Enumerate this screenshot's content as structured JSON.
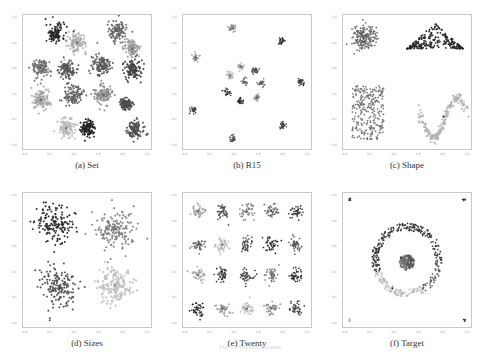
{
  "figure": {
    "caption": "Fig. — Synthetic datasets"
  },
  "chart_data": [
    {
      "type": "scatter",
      "title": "(a) Set",
      "xlim": [
        0.0,
        1.0
      ],
      "ylim": [
        0.0,
        1.0
      ],
      "xticks": [
        "0.0",
        "0.2",
        "0.4",
        "0.6",
        "0.8",
        "1.0"
      ],
      "yticks": [
        "1.0",
        "0.8",
        "0.6",
        "0.4",
        "0.2",
        "0.0"
      ],
      "grid": false,
      "clusters": [
        {
          "cx": 0.24,
          "cy": 0.88,
          "r": 0.07,
          "color": "#1e1e1e"
        },
        {
          "cx": 0.42,
          "cy": 0.81,
          "r": 0.07,
          "color": "#c8c8c8"
        },
        {
          "cx": 0.75,
          "cy": 0.9,
          "r": 0.07,
          "color": "#6e6e6e"
        },
        {
          "cx": 0.87,
          "cy": 0.76,
          "r": 0.06,
          "color": "#b4b4b4"
        },
        {
          "cx": 0.12,
          "cy": 0.61,
          "r": 0.07,
          "color": "#7a7a7a"
        },
        {
          "cx": 0.34,
          "cy": 0.6,
          "r": 0.06,
          "color": "#5a5a5a"
        },
        {
          "cx": 0.61,
          "cy": 0.63,
          "r": 0.07,
          "color": "#5c5c5c"
        },
        {
          "cx": 0.88,
          "cy": 0.6,
          "r": 0.07,
          "color": "#3c3c3c"
        },
        {
          "cx": 0.12,
          "cy": 0.36,
          "r": 0.07,
          "color": "#bebebe"
        },
        {
          "cx": 0.39,
          "cy": 0.4,
          "r": 0.07,
          "color": "#6a6a6a"
        },
        {
          "cx": 0.63,
          "cy": 0.4,
          "r": 0.07,
          "color": "#9a9a9a"
        },
        {
          "cx": 0.82,
          "cy": 0.33,
          "r": 0.04,
          "color": "#4a4a4a"
        },
        {
          "cx": 0.33,
          "cy": 0.14,
          "r": 0.07,
          "color": "#d6d6d6"
        },
        {
          "cx": 0.51,
          "cy": 0.14,
          "r": 0.06,
          "color": "#141414"
        },
        {
          "cx": 0.9,
          "cy": 0.13,
          "r": 0.06,
          "color": "#505050"
        }
      ]
    },
    {
      "type": "scatter",
      "title": "(b) R15",
      "xlim": [
        0.0,
        1.0
      ],
      "ylim": [
        0.0,
        1.0
      ],
      "xticks": [
        "0.0",
        "0.2",
        "0.4",
        "0.6",
        "0.8",
        "1.0"
      ],
      "yticks": [
        "1.0",
        "0.8",
        "0.6",
        "0.4",
        "0.2",
        "0.0"
      ],
      "grid": false,
      "clusters": [
        {
          "cx": 0.38,
          "cy": 0.92,
          "r": 0.025,
          "color": "#9a9a9a"
        },
        {
          "cx": 0.78,
          "cy": 0.82,
          "r": 0.025,
          "color": "#2a2a2a"
        },
        {
          "cx": 0.08,
          "cy": 0.69,
          "r": 0.025,
          "color": "#a0a0a0"
        },
        {
          "cx": 0.45,
          "cy": 0.62,
          "r": 0.025,
          "color": "#c8c8c8"
        },
        {
          "cx": 0.57,
          "cy": 0.59,
          "r": 0.025,
          "color": "#4a4a4a"
        },
        {
          "cx": 0.36,
          "cy": 0.55,
          "r": 0.025,
          "color": "#d2d2d2"
        },
        {
          "cx": 0.48,
          "cy": 0.5,
          "r": 0.025,
          "color": "#8a8a8a"
        },
        {
          "cx": 0.62,
          "cy": 0.49,
          "r": 0.025,
          "color": "#6a6a6a"
        },
        {
          "cx": 0.94,
          "cy": 0.5,
          "r": 0.025,
          "color": "#1e1e1e"
        },
        {
          "cx": 0.34,
          "cy": 0.42,
          "r": 0.025,
          "color": "#3a3a3a"
        },
        {
          "cx": 0.58,
          "cy": 0.38,
          "r": 0.025,
          "color": "#a8a8a8"
        },
        {
          "cx": 0.45,
          "cy": 0.35,
          "r": 0.025,
          "color": "#1a1a1a"
        },
        {
          "cx": 0.06,
          "cy": 0.28,
          "r": 0.025,
          "color": "#3c3c3c"
        },
        {
          "cx": 0.79,
          "cy": 0.16,
          "r": 0.025,
          "color": "#2c2c2c"
        },
        {
          "cx": 0.38,
          "cy": 0.05,
          "r": 0.025,
          "color": "#5a5a5a"
        }
      ]
    },
    {
      "type": "scatter",
      "title": "(c) Shape",
      "xlim": [
        0.0,
        1.0
      ],
      "ylim": [
        0.0,
        1.0
      ],
      "xticks": [
        "0.0",
        "0.2",
        "0.4",
        "0.6",
        "0.8",
        "1.0"
      ],
      "yticks": [
        "1.0",
        "0.8",
        "0.6",
        "0.4",
        "0.2",
        "0.0"
      ],
      "grid": false,
      "shapes": [
        {
          "kind": "blob",
          "cx": 0.14,
          "cy": 0.85,
          "r": 0.09,
          "color": "#6a6a6a"
        },
        {
          "kind": "triangle",
          "x0": 0.5,
          "x1": 0.96,
          "ybase": 0.76,
          "ytop": 0.96,
          "color": "#1e1e1e"
        },
        {
          "kind": "rect",
          "x0": 0.05,
          "x1": 0.31,
          "y0": 0.05,
          "y1": 0.47,
          "color": "#7a7a7a"
        },
        {
          "kind": "sine",
          "x0": 0.6,
          "x1": 0.99,
          "ymid": 0.22,
          "amp": 0.16,
          "color": "#cfcfcf"
        }
      ]
    },
    {
      "type": "scatter",
      "title": "(d) Sizes",
      "xlim": [
        0.0,
        1.0
      ],
      "ylim": [
        0.0,
        1.0
      ],
      "xticks": [
        "0.0",
        "0.2",
        "0.4",
        "0.6",
        "0.8",
        "1.0"
      ],
      "yticks": [
        "1.0",
        "0.8",
        "0.6",
        "0.4",
        "0.2",
        "0.0"
      ],
      "grid": false,
      "clusters": [
        {
          "cx": 0.24,
          "cy": 0.78,
          "r": 0.13,
          "color": "#222222"
        },
        {
          "cx": 0.73,
          "cy": 0.74,
          "r": 0.14,
          "color": "#8a8a8a"
        },
        {
          "cx": 0.26,
          "cy": 0.3,
          "r": 0.14,
          "color": "#4e4e4e"
        },
        {
          "cx": 0.73,
          "cy": 0.3,
          "r": 0.14,
          "color": "#d8d8d8"
        }
      ]
    },
    {
      "type": "scatter",
      "title": "(e) Twenty",
      "xlim": [
        0.0,
        1.0
      ],
      "ylim": [
        0.0,
        1.0
      ],
      "xticks": [
        "0.0",
        "0.2",
        "0.4",
        "0.6",
        "0.8",
        "1.0"
      ],
      "yticks": [
        "1.0",
        "0.8",
        "0.6",
        "0.4",
        "0.2",
        "0.0"
      ],
      "grid": false,
      "grid_clusters": {
        "cols": [
          0.1,
          0.3,
          0.5,
          0.7,
          0.9
        ],
        "rows": [
          0.88,
          0.62,
          0.38,
          0.12
        ],
        "r": 0.05,
        "colors": [
          "#b4b4b4",
          "#4a4a4a",
          "#8a8a8a",
          "#6a6a6a",
          "#3a3a3a",
          "#6e6e6e",
          "#d2d2d2",
          "#4e4e4e",
          "#1e1e1e",
          "#5a5a5a",
          "#bebebe",
          "#2e2e2e",
          "#3e3e3e",
          "#7a7a7a",
          "#262626",
          "#1a1a1a",
          "#a8a8a8",
          "#d8d8d8",
          "#9a9a9a",
          "#424242"
        ]
      }
    },
    {
      "type": "scatter",
      "title": "(f) Target",
      "xlim": [
        0.0,
        1.0
      ],
      "ylim": [
        0.0,
        1.0
      ],
      "xticks": [
        "0.0",
        "0.2",
        "0.4",
        "0.6",
        "0.8",
        "1.0"
      ],
      "yticks": [
        "1.0",
        "0.8",
        "0.6",
        "0.4",
        "0.2",
        "0.0"
      ],
      "grid": false,
      "target": {
        "center": {
          "cx": 0.5,
          "cy": 0.48,
          "r": 0.06,
          "colors": [
            "#7a7a7a",
            "#5a5a5a"
          ]
        },
        "ring": {
          "cx": 0.5,
          "cy": 0.5,
          "rin": 0.23,
          "rout": 0.29,
          "segments": [
            {
              "from": 0,
              "to": 200,
              "color": "#2a2a2a"
            },
            {
              "from": 200,
              "to": 300,
              "color": "#d6d6d6"
            },
            {
              "from": 300,
              "to": 360,
              "color": "#5a5a5a"
            }
          ]
        },
        "corners": [
          {
            "cx": 0.03,
            "cy": 0.97,
            "color": "#2a2a2a"
          },
          {
            "cx": 0.97,
            "cy": 0.97,
            "color": "#1e1e1e"
          },
          {
            "cx": 0.03,
            "cy": 0.03,
            "color": "#e0e0e0"
          },
          {
            "cx": 0.97,
            "cy": 0.03,
            "color": "#3a3a3a"
          }
        ]
      }
    }
  ]
}
